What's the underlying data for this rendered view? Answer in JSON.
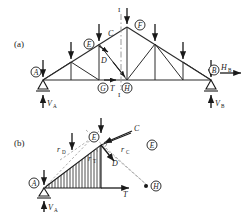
{
  "figure": {
    "type": "truss-method-of-sections",
    "panels": [
      {
        "id": "a",
        "tag": "(a)",
        "caption": ""
      },
      {
        "id": "b",
        "tag": "(b)",
        "caption": ""
      }
    ]
  },
  "panel_a": {
    "tag": "(a)",
    "supports": {
      "left": {
        "node": "A",
        "label": "A",
        "type": "pin-triangle",
        "reaction_label": "V",
        "reaction_sub": "A"
      },
      "right": {
        "node": "B",
        "label": "B",
        "type": "roller-triangle",
        "reaction_label": "V",
        "reaction_sub": "B",
        "horizontal_label": "H",
        "horizontal_sub": "B"
      }
    },
    "nodes": [
      {
        "id": "A",
        "label": "A",
        "circled": true,
        "x": 36,
        "y": 72
      },
      {
        "id": "E",
        "label": "E",
        "circled": true,
        "x": 100,
        "y": 46
      },
      {
        "id": "F",
        "label": "F",
        "circled": true,
        "x": 138,
        "y": 26
      },
      {
        "id": "G",
        "label": "G",
        "circled": true,
        "x": 104,
        "y": 80
      },
      {
        "id": "H",
        "label": "H",
        "circled": true,
        "x": 134,
        "y": 80
      },
      {
        "id": "B",
        "label": "B",
        "circled": true,
        "x": 212,
        "y": 72
      }
    ],
    "member_labels": [
      {
        "id": "C",
        "label": "C",
        "x": 113,
        "y": 33
      },
      {
        "id": "D",
        "label": "D",
        "x": 105,
        "y": 60
      },
      {
        "id": "T",
        "label": "T",
        "x": 114,
        "y": 80
      }
    ],
    "section_line": {
      "label_top": "I",
      "label_bottom": "I",
      "x": 121
    },
    "load_arrow_count": 7,
    "loads_note": "seven downward point loads on top chord and supports"
  },
  "panel_b": {
    "tag": "(b)",
    "freebody_note": "left free body cut at section I-I",
    "nodes": [
      {
        "id": "A",
        "label": "A",
        "circled": true
      },
      {
        "id": "E",
        "label": "E",
        "circled": true
      },
      {
        "id": "E2",
        "label": "E",
        "circled": true
      },
      {
        "id": "H",
        "label": "H",
        "circled": true
      }
    ],
    "forces": [
      {
        "id": "C",
        "label": "C",
        "kind": "compression-top-chord"
      },
      {
        "id": "D",
        "label": "D",
        "kind": "diagonal"
      },
      {
        "id": "T",
        "label": "T",
        "kind": "tension-bottom-chord"
      },
      {
        "id": "VA",
        "label": "V",
        "sub": "A",
        "kind": "reaction"
      }
    ],
    "lever_arms": [
      {
        "id": "rD",
        "label": "r",
        "sub": "D"
      },
      {
        "id": "rT",
        "label": "r",
        "sub": "T"
      },
      {
        "id": "rC",
        "label": "r",
        "sub": "C"
      }
    ],
    "hatching": "vertical-line-fill"
  },
  "colors": {
    "ink": "#1a1a1a",
    "line": "#2b2b2b",
    "dash": "#9a9a9a",
    "hatch": "#3a3a3a",
    "background": "#ffffff"
  }
}
